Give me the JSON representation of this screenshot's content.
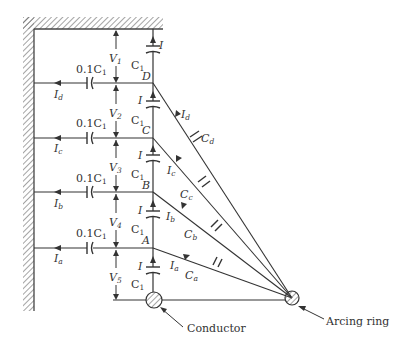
{
  "diagram": {
    "colors": {
      "line": "#333333",
      "background": "#ffffff"
    },
    "nodes": [
      {
        "id": "D",
        "label": "D",
        "y": 83
      },
      {
        "id": "C",
        "label": "C",
        "y": 138
      },
      {
        "id": "B",
        "label": "B",
        "y": 192
      },
      {
        "id": "A",
        "label": "A",
        "y": 248
      }
    ],
    "shunt_capacitor": {
      "label_prefix": "0.1C",
      "label_sub": "1"
    },
    "series_capacitor": {
      "label": "C",
      "label_sub": "1"
    },
    "series_current": "I",
    "shunt_currents": [
      {
        "main": "I",
        "sub": "d"
      },
      {
        "main": "I",
        "sub": "c"
      },
      {
        "main": "I",
        "sub": "b"
      },
      {
        "main": "I",
        "sub": "a"
      }
    ],
    "voltages": [
      {
        "main": "V",
        "sub": "1"
      },
      {
        "main": "V",
        "sub": "2"
      },
      {
        "main": "V",
        "sub": "3"
      },
      {
        "main": "V",
        "sub": "4"
      },
      {
        "main": "V",
        "sub": "5"
      }
    ],
    "ring_capacitors": [
      {
        "main": "C",
        "sub": "d"
      },
      {
        "main": "C",
        "sub": "c"
      },
      {
        "main": "C",
        "sub": "b"
      },
      {
        "main": "C",
        "sub": "a"
      }
    ],
    "ring_currents": [
      {
        "main": "I",
        "sub": "d"
      },
      {
        "main": "I",
        "sub": "c"
      },
      {
        "main": "I",
        "sub": "b"
      },
      {
        "main": "I",
        "sub": "a"
      }
    ],
    "callouts": {
      "conductor": "Conductor",
      "arcing_ring": "Arcing ring"
    }
  }
}
